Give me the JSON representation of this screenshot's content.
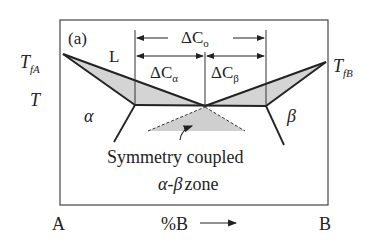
{
  "panel_label": "(a)",
  "labels": {
    "liquid": "L",
    "alpha": "α",
    "beta": "β",
    "temperature": "T",
    "tfa_main": "T",
    "tfa_sub": "fA",
    "tfb_main": "T",
    "tfb_sub": "fB"
  },
  "annotations": {
    "delta_c0": "ΔC",
    "delta_c0_sub": "o",
    "delta_c_alpha": "ΔC",
    "delta_c_alpha_sub": "α",
    "delta_c_beta": "ΔC",
    "delta_c_beta_sub": "β",
    "zone_line1": "Symmetry coupled",
    "zone_line2_greek": "α-β",
    "zone_line2_text": "zone"
  },
  "axis": {
    "left_end": "A",
    "right_end": "B",
    "composition": "%B"
  },
  "colors": {
    "line": "#222222",
    "fill": "#d4d4d4",
    "frame": "#444444"
  }
}
